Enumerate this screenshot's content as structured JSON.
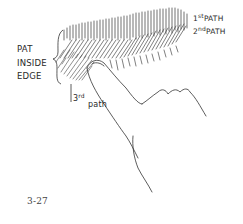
{
  "figure": {
    "number": "3-27"
  },
  "labels": {
    "pat_inside_edge": [
      "PAT",
      "INSIDE",
      "EDGE"
    ],
    "first_path": {
      "ordinal": "1",
      "suffix": "st",
      "word": "PATH"
    },
    "second_path": {
      "ordinal": "2",
      "suffix": "nd",
      "word": "PATH"
    },
    "third_path": {
      "ordinal": "3",
      "suffix": "rd",
      "word": "path"
    }
  },
  "colors": {
    "ink": "#2a2a2a",
    "background": "#ffffff"
  }
}
